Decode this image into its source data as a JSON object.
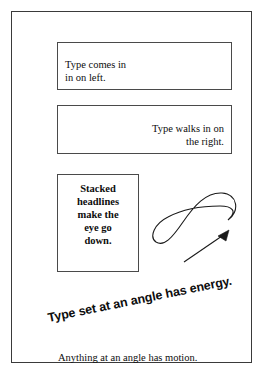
{
  "page": {
    "background_color": "#ffffff",
    "frame_border_color": "#3a3a3a",
    "text_color": "#0d0d0d"
  },
  "boxes": [
    {
      "id": "box-left",
      "name": "type-comes-in-left",
      "text": "Type comes in\nin on left.",
      "align": "left",
      "bold": false
    },
    {
      "id": "box-right",
      "name": "type-walks-in-right",
      "text": "Type walks in on\nthe right.",
      "align": "right",
      "bold": false
    },
    {
      "id": "box-stacked",
      "name": "stacked-headlines",
      "text": "Stacked\nheadlines\nmake the\neye go\ndown.",
      "align": "center",
      "bold": true
    }
  ],
  "drawing": {
    "name": "figure-eight-loop-with-arrow",
    "stroke_color": "#1a1a1a",
    "description": "Figure-eight loop rising left to right with a straight arrow beneath pointing up and to the right"
  },
  "angled_line": {
    "text": "Type set at an angle has energy.",
    "rotation_degrees": -11.5,
    "bold": true
  },
  "bottom_caption": {
    "text": "Anything at an angle has motion."
  }
}
